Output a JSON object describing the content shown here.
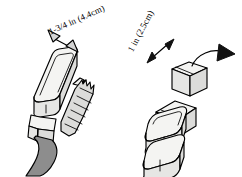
{
  "diagram": {
    "background_color": "#ffffff",
    "line_color": "#000000",
    "body_fill": "#f2f2f0",
    "shade_fill": "#e4e4e2",
    "arrow_fill": "#d9d9d9",
    "cable_fill": "#8a8a8a",
    "annotations": {
      "left_dimension": "1-3/4 in (4.4cm)",
      "right_dimension": "1 in (2.5cm)"
    },
    "figures": [
      {
        "id": "left-adapter",
        "name": "adapter-with-cable",
        "description": "Power adapter body with attached cable, double-headed dimension arrow indicating width"
      },
      {
        "id": "right-adapter",
        "name": "adapter-with-detached-plug-head",
        "description": "Power adapter base with detached plug head above, double-headed dimension arrow and curved removal arrow"
      }
    ],
    "arrows": [
      {
        "name": "left-dimension-arrow",
        "style": "double-headed",
        "orientation": "diagonal"
      },
      {
        "name": "right-dimension-arrow",
        "style": "double-headed",
        "orientation": "diagonal"
      },
      {
        "name": "removal-curved-arrow",
        "style": "curved-single-headed",
        "orientation": "rightward"
      }
    ]
  }
}
